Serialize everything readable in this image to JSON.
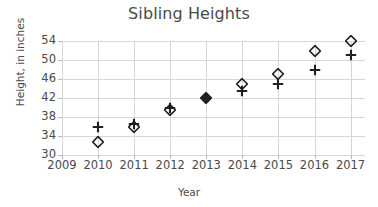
{
  "chart_data": {
    "type": "scatter",
    "title": "Sibling Heights",
    "xlabel": "Year",
    "ylabel": "Height, in inches",
    "grid": true,
    "legend": "none",
    "xlim": [
      2009,
      2017.4
    ],
    "ylim": [
      30,
      54
    ],
    "xticks": [
      "2009",
      "2010",
      "2011",
      "2012",
      "2013",
      "2014",
      "2015",
      "2016",
      "2017"
    ],
    "yticks": [
      "30",
      "34",
      "38",
      "42",
      "46",
      "50",
      "54"
    ],
    "x": [
      2009,
      2010,
      2011,
      2012,
      2013,
      2014,
      2015,
      2016,
      2017
    ],
    "series": [
      {
        "name": "sibling-diamond",
        "marker": "diamond-open",
        "color": "#231f20",
        "values": [
          null,
          32.8,
          36.0,
          39.5,
          42.0,
          45.0,
          47.0,
          52.0,
          54.0
        ]
      },
      {
        "name": "sibling-plus",
        "marker": "plus",
        "color": "#231f20",
        "values": [
          null,
          36.0,
          36.6,
          40.0,
          42.0,
          43.5,
          45.0,
          48.0,
          51.0
        ]
      }
    ]
  },
  "colors": {
    "grid": "#d6d6d6",
    "text": "#4a4a4a",
    "marker": "#231f20",
    "background": "#ffffff"
  }
}
